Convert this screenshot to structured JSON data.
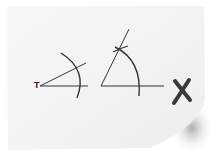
{
  "diagram": {
    "type": "geometry-construction",
    "point_label": "T",
    "mark_symbol": "X",
    "colors": {
      "paper": "#f4f4f4",
      "ink": "#333333",
      "shadow": "#9a9a9a",
      "mark": "#3a3a3a"
    },
    "figures": [
      {
        "name": "angle-30-construction",
        "vertex_label": "T"
      },
      {
        "name": "equilateral-60-construction"
      }
    ]
  }
}
